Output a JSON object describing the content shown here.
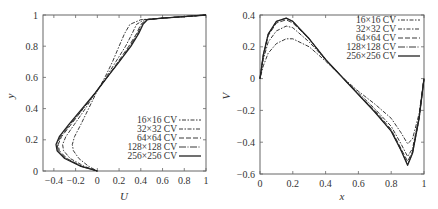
{
  "chart_data": [
    {
      "type": "line",
      "title": "",
      "xlabel": "U",
      "ylabel": "y",
      "xlim": [
        -0.5,
        1
      ],
      "ylim": [
        0,
        1
      ],
      "grid": false,
      "legend_position": "lower right",
      "xticks": [
        "-0.4",
        "-0.2",
        "0",
        "0.2",
        "0.4",
        "0.6",
        "0.8",
        "1"
      ],
      "xtick_values": [
        -0.4,
        -0.2,
        0,
        0.2,
        0.4,
        0.6,
        0.8,
        1
      ],
      "yticks": [
        "0",
        "0.2",
        "0.4",
        "0.6",
        "0.8",
        "1"
      ],
      "ytick_values": [
        0,
        0.2,
        0.4,
        0.6,
        0.8,
        1
      ],
      "series": [
        {
          "name": "16×16 CV",
          "dash": "1.5,1.5,4,1.5",
          "points": [
            [
              0,
              0
            ],
            [
              -0.08,
              0.03
            ],
            [
              -0.17,
              0.08
            ],
            [
              -0.22,
              0.13
            ],
            [
              -0.23,
              0.17
            ],
            [
              -0.21,
              0.22
            ],
            [
              -0.15,
              0.3
            ],
            [
              -0.08,
              0.4
            ],
            [
              -0.01,
              0.5
            ],
            [
              0.07,
              0.6
            ],
            [
              0.14,
              0.7
            ],
            [
              0.2,
              0.8
            ],
            [
              0.25,
              0.88
            ],
            [
              0.3,
              0.94
            ],
            [
              0.4,
              0.97
            ],
            [
              0.6,
              0.98
            ],
            [
              0.8,
              0.99
            ],
            [
              1,
              1
            ]
          ]
        },
        {
          "name": "32×32 CV",
          "dash": "4,1.5,1.5,1.5",
          "points": [
            [
              0,
              0
            ],
            [
              -0.12,
              0.03
            ],
            [
              -0.25,
              0.08
            ],
            [
              -0.31,
              0.13
            ],
            [
              -0.32,
              0.17
            ],
            [
              -0.29,
              0.22
            ],
            [
              -0.21,
              0.3
            ],
            [
              -0.11,
              0.4
            ],
            [
              -0.02,
              0.5
            ],
            [
              0.08,
              0.6
            ],
            [
              0.17,
              0.7
            ],
            [
              0.26,
              0.8
            ],
            [
              0.32,
              0.88
            ],
            [
              0.36,
              0.94
            ],
            [
              0.43,
              0.97
            ],
            [
              0.6,
              0.98
            ],
            [
              0.8,
              0.99
            ],
            [
              1,
              1
            ]
          ]
        },
        {
          "name": "64×64 CV",
          "dash": "5,2",
          "points": [
            [
              0,
              0
            ],
            [
              -0.14,
              0.03
            ],
            [
              -0.28,
              0.08
            ],
            [
              -0.35,
              0.13
            ],
            [
              -0.36,
              0.17
            ],
            [
              -0.33,
              0.22
            ],
            [
              -0.24,
              0.3
            ],
            [
              -0.13,
              0.4
            ],
            [
              -0.02,
              0.5
            ],
            [
              0.09,
              0.6
            ],
            [
              0.19,
              0.7
            ],
            [
              0.29,
              0.8
            ],
            [
              0.36,
              0.88
            ],
            [
              0.4,
              0.94
            ],
            [
              0.45,
              0.97
            ],
            [
              0.6,
              0.98
            ],
            [
              0.8,
              0.99
            ],
            [
              1,
              1
            ]
          ]
        },
        {
          "name": "128×128 CV",
          "dash": "7,1.5,1,1.5",
          "points": [
            [
              0,
              0
            ],
            [
              -0.15,
              0.03
            ],
            [
              -0.29,
              0.08
            ],
            [
              -0.36,
              0.13
            ],
            [
              -0.37,
              0.17
            ],
            [
              -0.34,
              0.22
            ],
            [
              -0.25,
              0.3
            ],
            [
              -0.13,
              0.4
            ],
            [
              -0.02,
              0.5
            ],
            [
              0.09,
              0.6
            ],
            [
              0.2,
              0.7
            ],
            [
              0.3,
              0.8
            ],
            [
              0.37,
              0.88
            ],
            [
              0.41,
              0.94
            ],
            [
              0.46,
              0.97
            ],
            [
              0.6,
              0.98
            ],
            [
              0.8,
              0.99
            ],
            [
              1,
              1
            ]
          ]
        },
        {
          "name": "256×256 CV",
          "dash": "",
          "points": [
            [
              0,
              0
            ],
            [
              -0.15,
              0.03
            ],
            [
              -0.3,
              0.08
            ],
            [
              -0.37,
              0.13
            ],
            [
              -0.38,
              0.17
            ],
            [
              -0.35,
              0.22
            ],
            [
              -0.26,
              0.3
            ],
            [
              -0.14,
              0.4
            ],
            [
              -0.02,
              0.5
            ],
            [
              0.09,
              0.6
            ],
            [
              0.2,
              0.7
            ],
            [
              0.31,
              0.8
            ],
            [
              0.38,
              0.88
            ],
            [
              0.42,
              0.94
            ],
            [
              0.46,
              0.97
            ],
            [
              0.6,
              0.98
            ],
            [
              0.8,
              0.99
            ],
            [
              1,
              1
            ]
          ]
        }
      ]
    },
    {
      "type": "line",
      "title": "",
      "xlabel": "x",
      "ylabel": "V",
      "xlim": [
        0,
        1
      ],
      "ylim": [
        -0.6,
        0.4
      ],
      "grid": false,
      "legend_position": "upper right",
      "xticks": [
        "0",
        "0.2",
        "0.4",
        "0.6",
        "0.8",
        "1"
      ],
      "xtick_values": [
        0,
        0.2,
        0.4,
        0.6,
        0.8,
        1
      ],
      "yticks": [
        "-0.6",
        "-0.4",
        "-0.2",
        "0",
        "0.2",
        "0.4"
      ],
      "ytick_values": [
        -0.6,
        -0.4,
        -0.2,
        0,
        0.2,
        0.4
      ],
      "series": [
        {
          "name": "16×16 CV",
          "dash": "1.5,1.5,4,1.5",
          "points": [
            [
              0,
              0
            ],
            [
              0.02,
              0.08
            ],
            [
              0.05,
              0.16
            ],
            [
              0.1,
              0.22
            ],
            [
              0.16,
              0.25
            ],
            [
              0.2,
              0.25
            ],
            [
              0.3,
              0.2
            ],
            [
              0.4,
              0.11
            ],
            [
              0.5,
              0.01
            ],
            [
              0.6,
              -0.08
            ],
            [
              0.7,
              -0.16
            ],
            [
              0.8,
              -0.25
            ],
            [
              0.86,
              -0.34
            ],
            [
              0.9,
              -0.41
            ],
            [
              0.93,
              -0.38
            ],
            [
              0.97,
              -0.22
            ],
            [
              1,
              0
            ]
          ]
        },
        {
          "name": "32×32 CV",
          "dash": "4,1.5,1.5,1.5",
          "points": [
            [
              0,
              0
            ],
            [
              0.02,
              0.12
            ],
            [
              0.05,
              0.23
            ],
            [
              0.1,
              0.3
            ],
            [
              0.16,
              0.33
            ],
            [
              0.2,
              0.32
            ],
            [
              0.3,
              0.23
            ],
            [
              0.4,
              0.12
            ],
            [
              0.5,
              0.01
            ],
            [
              0.6,
              -0.09
            ],
            [
              0.7,
              -0.19
            ],
            [
              0.8,
              -0.3
            ],
            [
              0.86,
              -0.41
            ],
            [
              0.9,
              -0.49
            ],
            [
              0.93,
              -0.44
            ],
            [
              0.97,
              -0.24
            ],
            [
              1,
              0
            ]
          ]
        },
        {
          "name": "64×64 CV",
          "dash": "5,2",
          "points": [
            [
              0,
              0
            ],
            [
              0.02,
              0.14
            ],
            [
              0.05,
              0.27
            ],
            [
              0.1,
              0.35
            ],
            [
              0.16,
              0.37
            ],
            [
              0.2,
              0.35
            ],
            [
              0.3,
              0.25
            ],
            [
              0.4,
              0.12
            ],
            [
              0.5,
              0.01
            ],
            [
              0.6,
              -0.1
            ],
            [
              0.7,
              -0.2
            ],
            [
              0.8,
              -0.32
            ],
            [
              0.86,
              -0.44
            ],
            [
              0.9,
              -0.52
            ],
            [
              0.93,
              -0.46
            ],
            [
              0.97,
              -0.25
            ],
            [
              1,
              0
            ]
          ]
        },
        {
          "name": "128×128 CV",
          "dash": "7,1.5,1,1.5",
          "points": [
            [
              0,
              0
            ],
            [
              0.02,
              0.15
            ],
            [
              0.05,
              0.28
            ],
            [
              0.1,
              0.36
            ],
            [
              0.16,
              0.38
            ],
            [
              0.2,
              0.36
            ],
            [
              0.3,
              0.25
            ],
            [
              0.4,
              0.12
            ],
            [
              0.5,
              0.01
            ],
            [
              0.6,
              -0.1
            ],
            [
              0.7,
              -0.21
            ],
            [
              0.8,
              -0.33
            ],
            [
              0.86,
              -0.45
            ],
            [
              0.9,
              -0.54
            ],
            [
              0.93,
              -0.47
            ],
            [
              0.97,
              -0.25
            ],
            [
              1,
              0
            ]
          ]
        },
        {
          "name": "256×256 CV",
          "dash": "",
          "points": [
            [
              0,
              0
            ],
            [
              0.02,
              0.15
            ],
            [
              0.05,
              0.28
            ],
            [
              0.1,
              0.36
            ],
            [
              0.16,
              0.38
            ],
            [
              0.2,
              0.36
            ],
            [
              0.3,
              0.25
            ],
            [
              0.4,
              0.12
            ],
            [
              0.5,
              0.01
            ],
            [
              0.6,
              -0.1
            ],
            [
              0.7,
              -0.21
            ],
            [
              0.8,
              -0.33
            ],
            [
              0.86,
              -0.45
            ],
            [
              0.9,
              -0.545
            ],
            [
              0.93,
              -0.47
            ],
            [
              0.97,
              -0.25
            ],
            [
              1,
              0
            ]
          ]
        }
      ]
    }
  ],
  "left_plot": {
    "xlabel": "U",
    "ylabel": "y",
    "legend": [
      "16×16 CV",
      "32×32 CV",
      "64×64 CV",
      "128×128 CV",
      "256×256 CV"
    ]
  },
  "right_plot": {
    "xlabel": "x",
    "ylabel": "V",
    "legend": [
      "16×16 CV",
      "32×32 CV",
      "64×64 CV",
      "128×128 CV",
      "256×256 CV"
    ]
  },
  "colors": {
    "axis": "#555555",
    "line": "#222222",
    "text": "#333333"
  }
}
